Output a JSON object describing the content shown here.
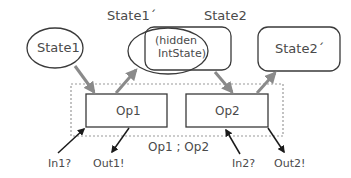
{
  "diagram": {
    "states": {
      "state1": "State1",
      "state1_prime": "State1´",
      "state2": "State2",
      "state2_prime": "State2´",
      "hidden_line1": "(hidden",
      "hidden_line2": "IntState)"
    },
    "operations": {
      "op1": "Op1",
      "op2": "Op2",
      "composition": "Op1 ; Op2"
    },
    "io": {
      "in1": "In1?",
      "out1": "Out1!",
      "in2": "In2?",
      "out2": "Out2!"
    },
    "colors": {
      "stroke": "#3a3a3a",
      "state_arrow": "#8a8a8a",
      "io_arrow": "#1a1a1a",
      "dashed_box": "#9a9a9a",
      "text": "#4a4a4a"
    }
  }
}
